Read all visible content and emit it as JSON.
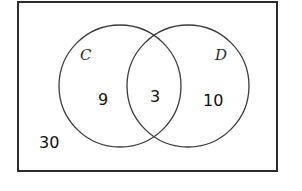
{
  "diagram": {
    "type": "venn",
    "universe": {
      "label": "",
      "outside_value": "30"
    },
    "sets": [
      {
        "id": "C",
        "label": "C",
        "only_value": "9"
      },
      {
        "id": "D",
        "label": "D",
        "only_value": "10"
      }
    ],
    "intersection": {
      "sets": [
        "C",
        "D"
      ],
      "value": "3"
    },
    "colors": {
      "stroke": "#2b2b2b",
      "background": "#ffffff",
      "text": "#111111"
    }
  }
}
